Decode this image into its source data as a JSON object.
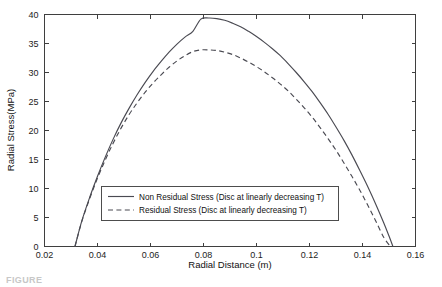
{
  "figure": {
    "background_color": "#ffffff",
    "line_color": "#4a4a52",
    "frame_color": "#3f3f3f",
    "caption_fragment": "FIGURE"
  },
  "chart_data": {
    "type": "line",
    "title": "",
    "xlabel": "Radial Distance (m)",
    "ylabel": "Radial Stress(MPa)",
    "xlim": [
      0.02,
      0.16
    ],
    "ylim": [
      0,
      40
    ],
    "xticks": [
      0.02,
      0.04,
      0.06,
      0.08,
      0.1,
      0.12,
      0.14,
      0.16
    ],
    "xticklabels": [
      "0.02",
      "0.04",
      "0.06",
      "0.08",
      "0.1",
      "0.12",
      "0.14",
      "0.16"
    ],
    "yticks": [
      0,
      5,
      10,
      15,
      20,
      25,
      30,
      35,
      40
    ],
    "yticklabels": [
      "0",
      "5",
      "10",
      "15",
      "20",
      "25",
      "30",
      "35",
      "40"
    ],
    "grid": false,
    "legend_position": "lower center",
    "series": [
      {
        "name": "Non Residual Stress (Disc at linearly decreasing T)",
        "style": "solid",
        "peak_x": 0.079,
        "peak_y": 39.4,
        "x": [
          0.0315,
          0.034,
          0.037,
          0.04,
          0.043,
          0.046,
          0.049,
          0.052,
          0.055,
          0.058,
          0.061,
          0.064,
          0.067,
          0.07,
          0.073,
          0.076,
          0.079,
          0.082,
          0.085,
          0.088,
          0.091,
          0.094,
          0.097,
          0.1,
          0.103,
          0.106,
          0.109,
          0.112,
          0.115,
          0.118,
          0.121,
          0.124,
          0.127,
          0.13,
          0.133,
          0.136,
          0.139,
          0.142,
          0.145,
          0.148,
          0.15,
          0.1515
        ],
        "y": [
          0.0,
          4.3,
          8.4,
          12.1,
          15.5,
          18.6,
          21.4,
          23.9,
          26.2,
          28.3,
          30.2,
          31.9,
          33.5,
          34.9,
          36.1,
          37.1,
          39.2,
          39.4,
          39.3,
          39.0,
          38.5,
          37.9,
          37.1,
          36.2,
          35.2,
          34.1,
          32.9,
          31.5,
          30.0,
          28.4,
          26.7,
          24.8,
          22.8,
          20.6,
          18.3,
          15.8,
          13.1,
          10.3,
          7.3,
          4.1,
          1.8,
          0.0
        ]
      },
      {
        "name": "Residual Stress (Disc at linearly decreasing T)",
        "style": "dashed",
        "peak_x": 0.0755,
        "peak_y": 33.9,
        "x": [
          0.0315,
          0.034,
          0.037,
          0.04,
          0.043,
          0.046,
          0.049,
          0.052,
          0.055,
          0.058,
          0.061,
          0.064,
          0.067,
          0.07,
          0.073,
          0.076,
          0.079,
          0.082,
          0.085,
          0.088,
          0.091,
          0.094,
          0.097,
          0.1,
          0.103,
          0.106,
          0.109,
          0.112,
          0.115,
          0.118,
          0.121,
          0.124,
          0.127,
          0.13,
          0.133,
          0.136,
          0.139,
          0.142,
          0.145,
          0.148,
          0.1505
        ],
        "y": [
          0.0,
          4.2,
          8.2,
          11.8,
          15.0,
          17.9,
          20.5,
          22.8,
          24.8,
          26.6,
          28.2,
          29.6,
          30.9,
          32.0,
          32.9,
          33.6,
          33.9,
          33.9,
          33.8,
          33.5,
          33.1,
          32.5,
          31.8,
          31.0,
          30.1,
          29.1,
          28.0,
          26.8,
          25.4,
          23.9,
          22.3,
          20.5,
          18.6,
          16.6,
          14.4,
          12.1,
          9.7,
          7.1,
          4.4,
          1.6,
          0.0
        ]
      }
    ],
    "legend_entries": [
      "Non Residual Stress (Disc at linearly decreasing T)",
      "Residual Stress (Disc at linearly decreasing T)"
    ]
  }
}
